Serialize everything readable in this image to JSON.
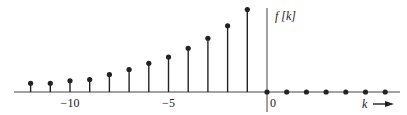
{
  "chart_data": {
    "type": "stem",
    "title": "",
    "xlabel": "k",
    "ylabel": "f [k]",
    "x": [
      -12,
      -11,
      -10,
      -9,
      -8,
      -7,
      -6,
      -5,
      -4,
      -3,
      -2,
      -1,
      0,
      1,
      2,
      3,
      4,
      5,
      6
    ],
    "values": [
      0.07,
      0.07,
      0.09,
      0.1,
      0.14,
      0.18,
      0.23,
      0.28,
      0.35,
      0.43,
      0.53,
      0.66,
      0,
      0,
      0,
      0,
      0,
      0,
      0
    ],
    "x_ticks": [
      {
        "value": -10,
        "label": "−10"
      },
      {
        "value": -5,
        "label": "−5"
      },
      {
        "value": 0,
        "label": "0"
      }
    ],
    "xlim": [
      -13,
      6.8
    ],
    "ylim": [
      0,
      0.8
    ],
    "grid": false,
    "legend": null
  },
  "labels": {
    "y_axis": "f [k]",
    "x_axis": "k"
  },
  "style": {
    "stem_color": "#222222",
    "axis_color": "#444444"
  }
}
